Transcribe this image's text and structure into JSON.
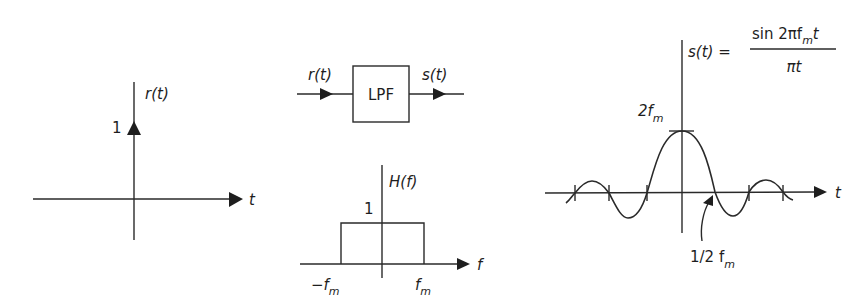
{
  "figure": {
    "panels": [
      {
        "id": "input-impulse",
        "vertical_label": "r(t)",
        "horizontal_label": "t",
        "impulse_height_label": "1"
      },
      {
        "id": "lpf-block",
        "input_label": "r(t)",
        "block_label": "LPF",
        "output_label": "s(t)"
      },
      {
        "id": "frequency-response",
        "vertical_label": "H(f)",
        "horizontal_label": "f",
        "height_label": "1",
        "left_edge_label": "−f",
        "left_edge_sub": "m",
        "right_edge_label": "f",
        "right_edge_sub": "m"
      },
      {
        "id": "output-sinc",
        "formula_lhs": "s(t) =",
        "formula_num_pre": "sin 2πf",
        "formula_num_sub": "m",
        "formula_num_post": "t",
        "formula_den": "πt",
        "peak_label": "2f",
        "peak_sub": "m",
        "horizontal_label": "t",
        "zero_crossing_label": "1/2 f",
        "zero_crossing_sub": "m"
      }
    ]
  }
}
